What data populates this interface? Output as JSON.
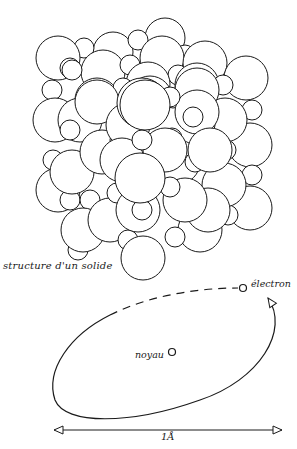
{
  "diagram": {
    "solid": {
      "caption": "structure d'un solide",
      "description": "close-packed cluster of spheres representing atoms in a solid"
    },
    "atom": {
      "nucleus_label": "noyau",
      "electron_label": "électron",
      "scale_label": "1Å"
    },
    "colors": {
      "stroke": "#1a1a1a",
      "fill": "#ffffff",
      "background": "#ffffff"
    }
  }
}
